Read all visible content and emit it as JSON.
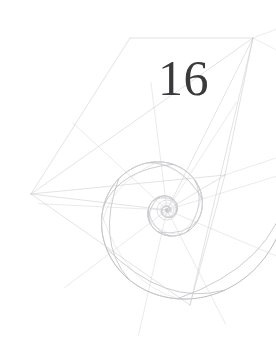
{
  "page": {
    "kind": "book-chapter-opener",
    "background_color": "#ffffff",
    "width": 276,
    "height": 356
  },
  "chapter": {
    "number": "16",
    "number_color": "#3a3a3c"
  },
  "figure": {
    "name": "nautilus-shell-diagram",
    "line_color": "#b3b3b8",
    "line_color_light": "#c9c9ce",
    "line_color_faint": "#d8d8dc",
    "stroke_width": 0.7,
    "geometry": {
      "spiral_center": [
        167,
        210
      ],
      "growth_factor": 1.36,
      "turns": 4.6,
      "start_radius": 126,
      "outer_vertices": [
        [
          253,
          38
        ],
        [
          31,
          194
        ],
        [
          190,
          305
        ],
        [
          225,
          175
        ],
        [
          130,
          38
        ]
      ],
      "radial_ray_count": 9,
      "septa_count": 22
    }
  }
}
